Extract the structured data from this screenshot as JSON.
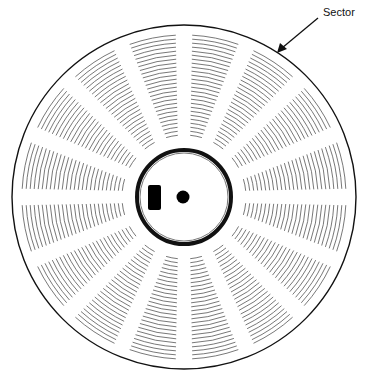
{
  "diagram": {
    "annotation": {
      "label": "Sector",
      "x": 323,
      "y": 6
    },
    "disk": {
      "center": [
        184,
        197
      ],
      "outer_radius": 172,
      "sector_count": 16,
      "track_inner_radius": 62,
      "track_outer_radius": 162,
      "track_count": 26,
      "hub_radius": 48,
      "line_color": "#111111",
      "track_color": "#555555"
    }
  }
}
